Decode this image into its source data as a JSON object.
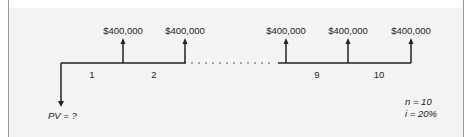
{
  "diagram": {
    "cash_flows": [
      {
        "label": "$400,000",
        "segment": "1"
      },
      {
        "label": "$400,000",
        "segment": "2"
      },
      {
        "label": "$400,000",
        "segment": "9"
      },
      {
        "label": "$400,000",
        "segment": "10"
      },
      {
        "label": "$400,000",
        "segment": ""
      }
    ],
    "period_labels": [
      "1",
      "2",
      "9",
      "10"
    ],
    "present_value_label": "PV = ?",
    "parameters": {
      "n_label": "n = 10",
      "i_label": "i = 20%"
    },
    "colors": {
      "line": "#222222",
      "background": "#f4f4f4"
    }
  }
}
